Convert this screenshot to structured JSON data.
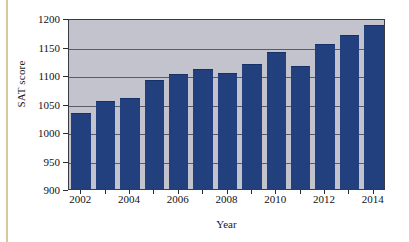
{
  "figure": {
    "background_color": "#ffffff",
    "plot_background_color": "#c3c3cd",
    "bar_color": "#22407e",
    "axis_color": "#3a3a44",
    "gridline_color": "#5c5c66",
    "edge_artifact_color": "#d9c69a"
  },
  "chart_data": {
    "type": "bar",
    "title": "",
    "xlabel": "Year",
    "ylabel": "SAT score",
    "categories": [
      "2002",
      "2003",
      "2004",
      "2005",
      "2006",
      "2007",
      "2008",
      "2009",
      "2010",
      "2011",
      "2012",
      "2013",
      "2014"
    ],
    "values": [
      1033,
      1055,
      1060,
      1092,
      1102,
      1110,
      1104,
      1120,
      1141,
      1115,
      1155,
      1171,
      1188
    ],
    "ylim": [
      900,
      1200
    ],
    "yticks": [
      900,
      950,
      1000,
      1050,
      1100,
      1150,
      1200
    ],
    "ytick_labels": [
      "900",
      "950",
      "1000",
      "1050",
      "1100",
      "1150",
      "1200"
    ],
    "xtick_labels_shown": [
      "2002",
      "2004",
      "2006",
      "2008",
      "2010",
      "2012",
      "2014"
    ],
    "grid": true,
    "grid_axis": "y",
    "legend": false,
    "legend_position": "none",
    "series": [
      {
        "name": "SAT score",
        "values": [
          1033,
          1055,
          1060,
          1092,
          1102,
          1110,
          1104,
          1120,
          1141,
          1115,
          1155,
          1171,
          1188
        ]
      }
    ]
  }
}
